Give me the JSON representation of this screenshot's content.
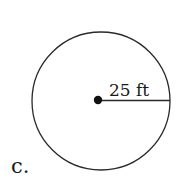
{
  "figure": {
    "part_label": "c.",
    "radius_label": "25 ft",
    "shape": "circle",
    "radius_value": 25,
    "radius_unit": "ft",
    "colors": {
      "stroke": "#2a2a2a",
      "text": "#1a1a1a",
      "background": "#ffffff"
    }
  }
}
